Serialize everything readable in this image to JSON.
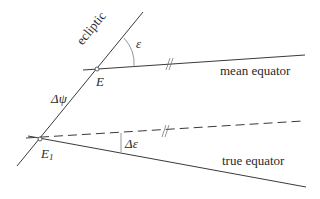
{
  "diagram": {
    "colors": {
      "line": "#3a3a3a",
      "text": "#2a2a2a",
      "background": "#ffffff"
    },
    "labels": {
      "ecliptic": "ecliptic",
      "epsilon": "ε",
      "point_E": "E",
      "mean_equator": "mean equator",
      "delta_psi": "Δψ",
      "point_E1_main": "E",
      "point_E1_sub": "1",
      "delta_epsilon": "Δε",
      "true_equator": "true equator"
    },
    "elements": [
      {
        "name": "ecliptic",
        "type": "line",
        "style": "solid"
      },
      {
        "name": "mean equator",
        "type": "line",
        "style": "solid"
      },
      {
        "name": "mean equator (shifted parallel)",
        "type": "line",
        "style": "dashed"
      },
      {
        "name": "true equator",
        "type": "line",
        "style": "solid"
      },
      {
        "name": "E",
        "type": "point",
        "description": "intersection of ecliptic and mean equator"
      },
      {
        "name": "E1",
        "type": "point",
        "description": "intersection of ecliptic and true equator"
      },
      {
        "name": "ε",
        "type": "angle",
        "description": "angle between ecliptic and mean equator"
      },
      {
        "name": "Δε",
        "type": "angle",
        "description": "angle between dashed parallel and true equator"
      },
      {
        "name": "Δψ",
        "type": "segment",
        "description": "arc along ecliptic from E to E1"
      },
      {
        "name": "parallel marks",
        "type": "marker",
        "glyph": "//"
      }
    ]
  }
}
